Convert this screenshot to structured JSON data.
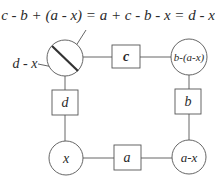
{
  "equation": "c - b + (a - x) = a + c - b - x = d - x",
  "pointer_label": "d - x",
  "nodes": {
    "top_left_circle": {
      "label": "",
      "marked": true
    },
    "top_right_circle": {
      "label": "b-(a-x)"
    },
    "bottom_left_circle": {
      "label": "x"
    },
    "bottom_right_circle": {
      "label": "a-x"
    }
  },
  "edges": {
    "top": {
      "label": "c"
    },
    "right": {
      "label": "b"
    },
    "bottom": {
      "label": "a"
    },
    "left": {
      "label": "d"
    }
  },
  "colors": {
    "line": "#555555",
    "text": "#2a2a2a",
    "background": "#ffffff"
  }
}
